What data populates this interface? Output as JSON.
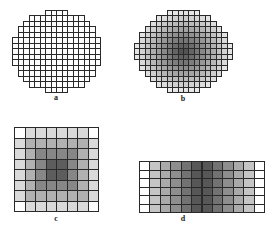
{
  "figures": [
    {
      "id": "a",
      "label": "a",
      "shape": "circle",
      "shading": "none",
      "description": "Circular arrangement of unshaded square cells"
    },
    {
      "id": "b",
      "label": "b",
      "shape": "circle",
      "shading": "radial-dark-center",
      "description": "Circular arrangement of cells shaded darker toward the center"
    },
    {
      "id": "c",
      "label": "c",
      "shape": "square",
      "shading": "radial-dark-center",
      "grid": {
        "cols": 8,
        "rows": 8
      },
      "description": "Square grid with corner cells unshaded and density increasing toward the center"
    },
    {
      "id": "d",
      "label": "d",
      "shape": "rectangle",
      "shading": "horizontal-dark-center",
      "grid": {
        "cols": 12,
        "rows": 6
      },
      "description": "Rectangular grid with unshaded end columns and density increasing toward the center"
    }
  ],
  "colors": {
    "line": "#2a2a2a",
    "dark": "#151515",
    "background": "#ffffff"
  }
}
